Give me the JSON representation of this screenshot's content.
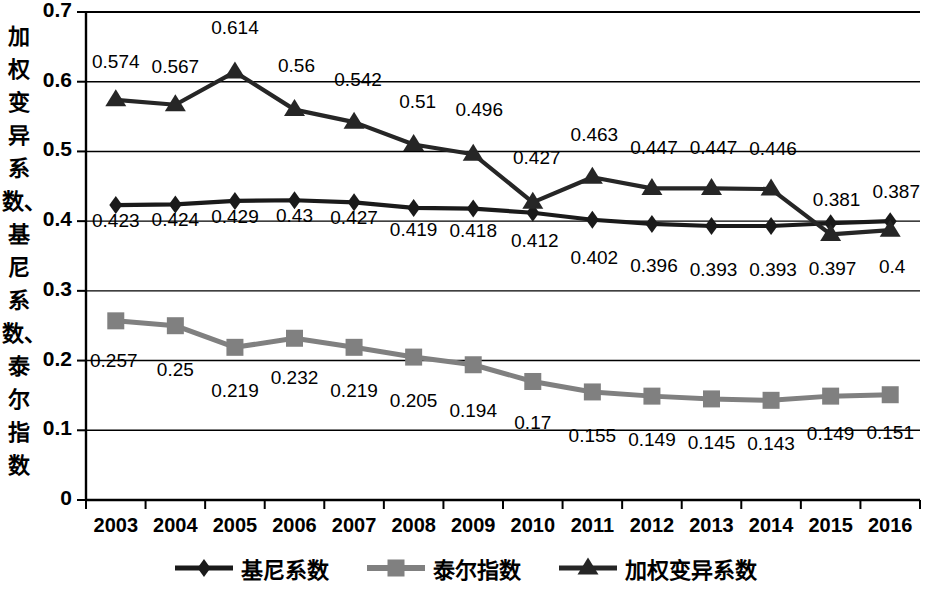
{
  "chart_data": {
    "type": "line",
    "title": "",
    "xlabel": "",
    "ylabel": "加权变异系数、基尼系数、泰尔指数",
    "categories": [
      "2003",
      "2004",
      "2005",
      "2006",
      "2007",
      "2008",
      "2009",
      "2010",
      "2011",
      "2012",
      "2013",
      "2014",
      "2015",
      "2016"
    ],
    "ylim": [
      0,
      0.7
    ],
    "yticks": [
      "0",
      "0.1",
      "0.2",
      "0.3",
      "0.4",
      "0.5",
      "0.6",
      "0.7"
    ],
    "grid": true,
    "legend_position": "bottom",
    "series": [
      {
        "name": "基尼系数",
        "marker": "diamond",
        "color": "#1a1a1a",
        "values": [
          0.423,
          0.424,
          0.429,
          0.43,
          0.427,
          0.419,
          0.418,
          0.412,
          0.402,
          0.396,
          0.393,
          0.393,
          0.397,
          0.4
        ],
        "labels": [
          "0.423",
          "0.424",
          "0.429",
          "0.43",
          "0.427",
          "0.419",
          "0.418",
          "0.412",
          "0.402",
          "0.396",
          "0.393",
          "0.393",
          "0.397",
          "0.4"
        ]
      },
      {
        "name": "泰尔指数",
        "marker": "square",
        "color": "#808080",
        "values": [
          0.257,
          0.25,
          0.219,
          0.232,
          0.219,
          0.205,
          0.194,
          0.17,
          0.155,
          0.149,
          0.145,
          0.143,
          0.149,
          0.151
        ],
        "labels": [
          "0.257",
          "0.25",
          "0.219",
          "0.232",
          "0.219",
          "0.205",
          "0.194",
          "0.17",
          "0.155",
          "0.149",
          "0.145",
          "0.143",
          "0.149",
          "0.151"
        ]
      },
      {
        "name": "加权变异系数",
        "marker": "triangle",
        "color": "#262626",
        "values": [
          0.574,
          0.567,
          0.614,
          0.56,
          0.542,
          0.51,
          0.496,
          0.427,
          0.463,
          0.447,
          0.447,
          0.446,
          0.381,
          0.387
        ],
        "labels": [
          "0.574",
          "0.567",
          "0.614",
          "0.56",
          "0.542",
          "0.51",
          "0.496",
          "0.427",
          "0.463",
          "0.447",
          "0.447",
          "0.446",
          "0.381",
          "0.387"
        ]
      }
    ]
  },
  "legend": {
    "items": [
      {
        "label": "基尼系数",
        "marker": "diamond",
        "color": "#1a1a1a"
      },
      {
        "label": "泰尔指数",
        "marker": "square",
        "color": "#808080"
      },
      {
        "label": "加权变异系数",
        "marker": "triangle",
        "color": "#262626"
      }
    ]
  }
}
